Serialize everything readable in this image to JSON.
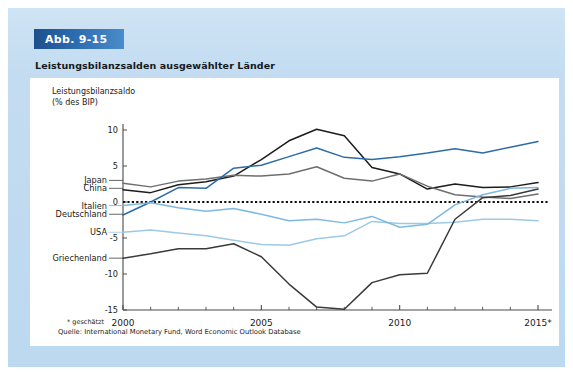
{
  "figure": {
    "number_label": "Abb. 9-15",
    "title": "Leistungsbilanzsalden ausgewählter Länder",
    "axis_title": "Leistungsbilanzsaldo\n(% des BIP)",
    "footnote": "* geschätzt",
    "source": "Quelle: International Monetary Fund, Word Economic Outlook Database",
    "accent_color": "#2d6bb0",
    "panel_color": "#c3dcf1"
  },
  "chart_data": {
    "type": "line",
    "title": "Leistungsbilanzsalden ausgewählter Länder",
    "xlabel": "",
    "ylabel": "Leistungsbilanzsaldo (% des BIP)",
    "xlim": [
      2000,
      2015
    ],
    "ylim": [
      -15,
      10
    ],
    "yticks": [
      10,
      5,
      0,
      -5,
      -10,
      -15
    ],
    "ytick_labels": [
      "10",
      "5",
      "0",
      "-5",
      "-10",
      "-15"
    ],
    "xticks": [
      2000,
      2005,
      2010,
      2015
    ],
    "xtick_labels": [
      "2000",
      "2005",
      "2010",
      "2015*"
    ],
    "grid": false,
    "zero_line": true,
    "zero_line_style": "dotted",
    "legend_position": "left-inline-labels",
    "x": [
      2000,
      2001,
      2002,
      2003,
      2004,
      2005,
      2006,
      2007,
      2008,
      2009,
      2010,
      2011,
      2012,
      2013,
      2014,
      2015
    ],
    "series": [
      {
        "name": "China",
        "color": "#1c1c1c",
        "label_y_value": 1.9,
        "values": [
          1.7,
          1.3,
          2.4,
          2.8,
          3.6,
          5.9,
          8.5,
          10.1,
          9.2,
          4.8,
          3.9,
          1.8,
          2.5,
          2.0,
          2.1,
          2.7
        ]
      },
      {
        "name": "Japan",
        "color": "#6e6e6e",
        "label_y_value": 3.0,
        "values": [
          2.6,
          2.1,
          2.9,
          3.2,
          3.7,
          3.6,
          3.9,
          4.9,
          3.3,
          2.9,
          3.9,
          2.2,
          1.0,
          0.7,
          0.5,
          1.1
        ]
      },
      {
        "name": "Deutschland",
        "color": "#2e6ca6",
        "label_y_value": -1.7,
        "values": [
          -1.8,
          0.0,
          2.0,
          1.9,
          4.7,
          5.1,
          6.3,
          7.5,
          6.2,
          5.9,
          6.3,
          6.8,
          7.4,
          6.8,
          7.6,
          8.4
        ]
      },
      {
        "name": "USA",
        "color": "#9dc9e8",
        "label_y_value": -4.2,
        "values": [
          -4.2,
          -3.9,
          -4.3,
          -4.7,
          -5.3,
          -5.9,
          -6.0,
          -5.1,
          -4.7,
          -2.7,
          -3.0,
          -3.0,
          -2.8,
          -2.4,
          -2.4,
          -2.6
        ]
      },
      {
        "name": "Italien",
        "color": "#7fb8e0",
        "label_y_value": -0.5,
        "values": [
          -0.5,
          -0.1,
          -0.8,
          -1.3,
          -0.9,
          -1.7,
          -2.6,
          -2.4,
          -2.9,
          -2.0,
          -3.5,
          -3.1,
          -0.4,
          1.0,
          1.9,
          2.0
        ]
      },
      {
        "name": "Griechenland",
        "color": "#3a3a3a",
        "label_y_value": -7.8,
        "values": [
          -7.8,
          -7.2,
          -6.5,
          -6.5,
          -5.8,
          -7.6,
          -11.4,
          -14.6,
          -14.9,
          -11.2,
          -10.1,
          -9.9,
          -2.4,
          0.6,
          0.9,
          1.8
        ]
      }
    ]
  }
}
